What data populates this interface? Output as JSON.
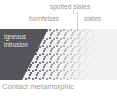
{
  "figure": {
    "caption": "Contact metamorphic",
    "callouts": [
      {
        "id": "spotted",
        "label": "spotted slates"
      },
      {
        "id": "hornfels",
        "label": "hornfelses"
      },
      {
        "id": "slates",
        "label": "slates"
      }
    ],
    "panel": {
      "intrusion_label_line1": "igneous",
      "intrusion_label_line2": "intrusion"
    },
    "colors": {
      "intrusion_fill": "#55555b",
      "intrusion_text": "#e3e3e5",
      "stipple_dot": "#3e3e44",
      "slates_fill": "#f2f2f4",
      "slates_dot": "#c3c3c9",
      "label_text": "#96969a",
      "caption_text": "#9a9a9e",
      "leader_line": "#d2d2d5",
      "background": "#ffffff"
    }
  }
}
